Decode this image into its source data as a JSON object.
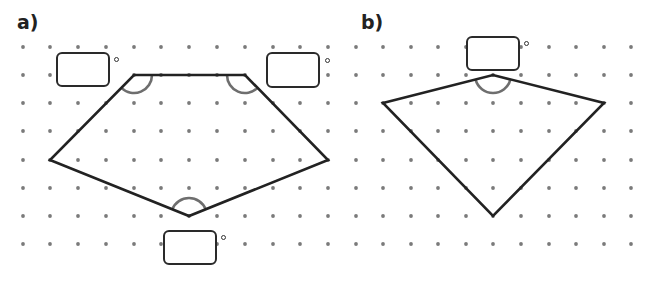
{
  "diagram": {
    "colors": {
      "background": "#ffffff",
      "dot": "#7a7a7a",
      "shape_stroke": "#222222",
      "angle_arc": "#6e6e6e",
      "box_border": "#2a2a2a"
    },
    "grid": {
      "spacing_px": 27.8,
      "rows_y": [
        47,
        75,
        103,
        131,
        160,
        188,
        216,
        244
      ]
    },
    "parts": [
      {
        "id": "a",
        "label": "a)",
        "label_pos": [
          17,
          13
        ],
        "shape": "pentagon",
        "grid_columns_x": [
          23,
          50,
          78,
          106,
          134,
          161,
          189,
          217,
          245,
          273,
          300,
          328
        ],
        "vertices": [
          [
            134,
            75
          ],
          [
            245,
            75
          ],
          [
            328,
            160
          ],
          [
            189,
            216
          ],
          [
            50,
            160
          ]
        ],
        "marked_angles": [
          {
            "vertex": [
              134,
              75
            ],
            "arc_radius": 18,
            "answer_box": {
              "x": 56,
              "y": 52,
              "w": 54,
              "h": 35
            },
            "degree_symbol": [
              114,
              57
            ],
            "value": ""
          },
          {
            "vertex": [
              245,
              75
            ],
            "arc_radius": 18,
            "answer_box": {
              "x": 266,
              "y": 52,
              "w": 54,
              "h": 36
            },
            "degree_symbol": [
              325,
              58
            ],
            "value": ""
          },
          {
            "vertex": [
              189,
              216
            ],
            "arc_radius": 18,
            "answer_box": {
              "x": 163,
              "y": 230,
              "w": 54,
              "h": 35
            },
            "degree_symbol": [
              221,
              235
            ],
            "value": ""
          }
        ]
      },
      {
        "id": "b",
        "label": "b)",
        "label_pos": [
          361,
          13
        ],
        "shape": "kite",
        "grid_columns_x": [
          356,
          383,
          411,
          438,
          466,
          493,
          521,
          549,
          576,
          604,
          631
        ],
        "vertices": [
          [
            383,
            103
          ],
          [
            493,
            75
          ],
          [
            604,
            103
          ],
          [
            493,
            216
          ]
        ],
        "marked_angles": [
          {
            "vertex": [
              493,
              75
            ],
            "arc_radius": 18,
            "answer_box": {
              "x": 466,
              "y": 36,
              "w": 54,
              "h": 35
            },
            "degree_symbol": [
              524,
              41
            ],
            "value": ""
          }
        ]
      }
    ],
    "degree_symbol": "°"
  }
}
